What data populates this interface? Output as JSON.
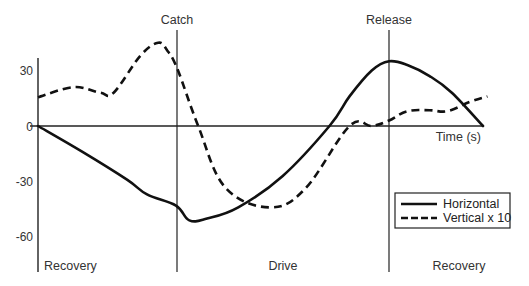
{
  "chart_data": {
    "type": "line",
    "title": "",
    "xlabel": "Time (s)",
    "ylabel": "",
    "ylim": [
      -75,
      52
    ],
    "yticks": [
      30,
      0,
      -30,
      -60
    ],
    "grid": false,
    "legend_position": "lower right",
    "x_units": "normalized fraction of stroke cycle (0 = start, 1 = end)",
    "phase_markers": [
      {
        "label": "Catch",
        "x": 0.313
      },
      {
        "label": "Release",
        "x": 0.789
      }
    ],
    "phase_regions": [
      {
        "label": "Recovery",
        "x_start": 0.0,
        "x_end": 0.313
      },
      {
        "label": "Drive",
        "x_start": 0.313,
        "x_end": 0.789
      },
      {
        "label": "Recovery",
        "x_start": 0.789,
        "x_end": 1.0
      }
    ],
    "series": [
      {
        "name": "Horizontal",
        "style": "solid",
        "x": [
          0.0,
          0.1,
          0.2,
          0.245,
          0.31,
          0.34,
          0.38,
          0.45,
          0.55,
          0.655,
          0.7,
          0.75,
          0.789,
          0.83,
          0.88,
          0.93,
          1.0
        ],
        "y": [
          0,
          -14,
          -29,
          -37,
          -43,
          -51,
          -50,
          -44,
          -27,
          0,
          16,
          30,
          35,
          33,
          27,
          18,
          0
        ]
      },
      {
        "name": "Vertical x 10",
        "style": "dashed",
        "x": [
          0.0,
          0.08,
          0.14,
          0.17,
          0.23,
          0.27,
          0.29,
          0.313,
          0.36,
          0.42,
          0.52,
          0.6,
          0.7,
          0.75,
          0.789,
          0.83,
          0.88,
          0.92,
          0.97,
          1.01
        ],
        "y": [
          15.5,
          21,
          18,
          18,
          38,
          45,
          41,
          31,
          0,
          -33,
          -44,
          -34,
          0,
          0,
          3,
          8,
          8.5,
          8,
          13,
          16
        ]
      }
    ]
  },
  "axis": {
    "y_tick_labels": [
      "30",
      "0",
      "-30",
      "-60"
    ],
    "x_label": "Time (s)"
  },
  "markers": {
    "catch": "Catch",
    "release": "Release"
  },
  "regions": {
    "recovery_left": "Recovery",
    "drive": "Drive",
    "recovery_right": "Recovery"
  },
  "legend": {
    "items": [
      {
        "label": "Horizontal",
        "style": "solid"
      },
      {
        "label": "Vertical x 10",
        "style": "dashed"
      }
    ]
  }
}
